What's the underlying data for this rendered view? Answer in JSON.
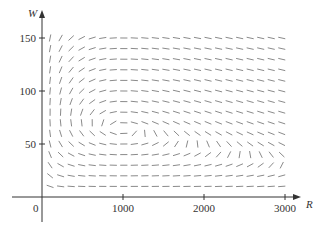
{
  "chart_data": {
    "type": "direction-field",
    "title": "",
    "xlabel": "R",
    "ylabel": "W",
    "origin_label": "0",
    "xlim": [
      0,
      3200
    ],
    "ylim": [
      0,
      165
    ],
    "x_ticks": [
      {
        "value": 1000,
        "label": "1000"
      },
      {
        "value": 2000,
        "label": "2000"
      },
      {
        "value": 3000,
        "label": "3000"
      }
    ],
    "y_ticks": [
      {
        "value": 50,
        "label": "50"
      },
      {
        "value": 100,
        "label": "100"
      },
      {
        "value": 150,
        "label": "150"
      }
    ],
    "grid": false,
    "field": {
      "description": "Phase-plane direction field for a predator-prey system (R = prey, W = predators)",
      "equations": {
        "dR_dt": "0.08*R*(1 - 0.0002*R) - 0.001*R*W",
        "dW_dt": "-0.02*W + 0.00002*R*W"
      },
      "params": {
        "a": 0.08,
        "k": 0.0002,
        "b": 0.001,
        "c": 0.02,
        "d": 2e-05
      },
      "equilibrium_approx": {
        "R": 1000,
        "W": 64
      },
      "R_samples": {
        "start": 100,
        "end": 3000,
        "step": 130
      },
      "W_samples": {
        "start": 10,
        "end": 150,
        "step": 10
      }
    },
    "colors": {
      "axis": "#333333",
      "segment": "#8a8a8a",
      "text": "#333333"
    }
  }
}
